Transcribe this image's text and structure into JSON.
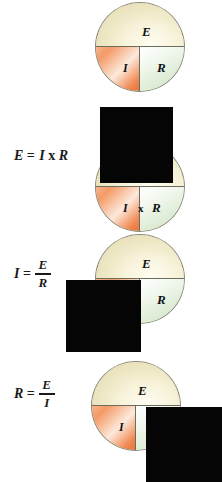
{
  "diagram": {
    "title": "Ohm's Law circle memory aid",
    "wheel_labels": {
      "top": "E",
      "bottom_left": "I",
      "bottom_right": "R",
      "multiply": "x"
    },
    "colors": {
      "top_segment": "#f0e8c4",
      "bottom_left_segment": "#f09a60",
      "bottom_right_segment": "#dcecd4",
      "outline": "#6d6d5c",
      "cover": "#050505",
      "text": "#111111"
    },
    "rows": [
      {
        "id": "reference-wheel",
        "formula": null,
        "covered": null,
        "wheel": {
          "top": "E",
          "bottom_left": "I",
          "bottom_right": "R",
          "multiply": null
        }
      },
      {
        "id": "solve-for-E",
        "formula": {
          "lhs": "E",
          "equals": "=",
          "kind": "product",
          "factor_a": "I",
          "operator": "x",
          "factor_b": "R",
          "text": "E = I x R"
        },
        "covered": "E",
        "wheel": {
          "top": "E",
          "bottom_left": "I",
          "bottom_right": "R",
          "multiply": "x"
        }
      },
      {
        "id": "solve-for-I",
        "formula": {
          "lhs": "I",
          "equals": "=",
          "kind": "fraction",
          "numerator": "E",
          "denominator": "R",
          "text": "I = E / R"
        },
        "covered": "I",
        "wheel": {
          "top": "E",
          "bottom_left": "I",
          "bottom_right": "R",
          "multiply": null
        }
      },
      {
        "id": "solve-for-R",
        "formula": {
          "lhs": "R",
          "equals": "=",
          "kind": "fraction",
          "numerator": "E",
          "denominator": "I",
          "text": "R = E / I"
        },
        "covered": "R",
        "wheel": {
          "top": "E",
          "bottom_left": "I",
          "bottom_right": "R",
          "multiply": null
        }
      }
    ]
  }
}
